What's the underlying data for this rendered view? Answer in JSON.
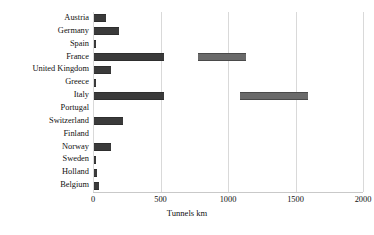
{
  "chart_data": {
    "type": "bar",
    "orientation": "horizontal",
    "title": "",
    "xlabel": "Tunnels km",
    "ylabel": "",
    "xlim": [
      0,
      2000
    ],
    "xticks": [
      0,
      500,
      1000,
      1500,
      2000
    ],
    "grid": true,
    "legend": false,
    "categories": [
      "Austria",
      "Germany",
      "Spain",
      "France",
      "United Kingdom",
      "Greece",
      "Italy",
      "Portugal",
      "Switzerland",
      "Finland",
      "Norway",
      "Sweden",
      "Holland",
      "Belgium"
    ],
    "values": [
      90,
      185,
      10,
      520,
      125,
      10,
      520,
      0,
      215,
      0,
      125,
      15,
      25,
      40
    ],
    "secondary_segments": [
      {
        "category": "France",
        "start": 775,
        "end": 1130
      },
      {
        "category": "Italy",
        "start": 1090,
        "end": 1590
      }
    ]
  },
  "axis": {
    "x_title": "Tunnels km",
    "tick_labels": [
      "0",
      "500",
      "1000",
      "1500",
      "2000"
    ]
  },
  "colors": {
    "bar": "#555555",
    "bar_edge": "#2e2e2e",
    "bar_secondary": "#6a6a6a",
    "gridline": "#d9d9d9",
    "text": "#111111",
    "background": "#ffffff"
  }
}
